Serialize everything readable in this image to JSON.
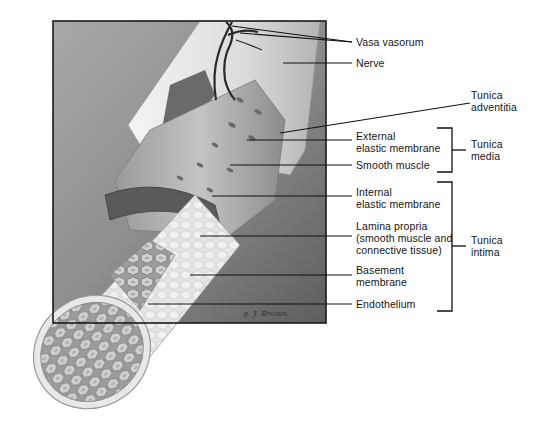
{
  "diagram": {
    "labels": {
      "vasa_vasorum": "Vasa vasorum",
      "nerve": "Nerve",
      "tunica_adventitia_1": "Tunica",
      "tunica_adventitia_2": "adventitia",
      "external_elastic_1": "External",
      "external_elastic_2": "elastic membrane",
      "smooth_muscle": "Smooth muscle",
      "internal_elastic_1": "Internal",
      "internal_elastic_2": "elastic membrane",
      "lamina_propria_1": "Lamina propria",
      "lamina_propria_2": "(smooth muscle and",
      "lamina_propria_3": "connective tissue)",
      "basement_1": "Basement",
      "basement_2": "membrane",
      "endothelium": "Endothelium"
    },
    "groups": {
      "tunica_media_1": "Tunica",
      "tunica_media_2": "media",
      "tunica_intima_1": "Tunica",
      "tunica_intima_2": "intima"
    },
    "signature": "g. J. Brown",
    "colors": {
      "frame_bg": "#8a8a8a",
      "frame_border": "#1a1a1a",
      "leader_line": "#111111",
      "tube_light": "#e6e6e6",
      "tube_mid": "#b8b8b8",
      "tube_dark": "#6e6e6e"
    }
  }
}
